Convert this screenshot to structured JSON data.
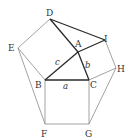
{
  "diagram": {
    "points": {
      "A": "A",
      "B": "B",
      "C": "C",
      "D": "D",
      "E": "E",
      "F": "F",
      "G": "G",
      "H": "H",
      "I": "I"
    },
    "sides": {
      "a": "a",
      "b": "b",
      "c": "c"
    },
    "colors": {
      "thin": "#8a8a8a",
      "bold": "#2a2a2a"
    }
  }
}
